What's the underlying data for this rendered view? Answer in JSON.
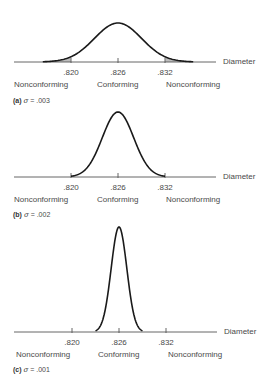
{
  "chart_data": [
    {
      "type": "line",
      "title": "(a) σ = .003",
      "panel": "a",
      "sigma": 0.003,
      "mean": 0.826,
      "xlabel": "Diameter",
      "ticks": [
        ".820",
        ".826",
        ".832"
      ],
      "tick_values": [
        0.82,
        0.826,
        0.832
      ],
      "regions": [
        "Nonconforming",
        "Conforming",
        "Nonconforming"
      ],
      "spec_limits": [
        0.82,
        0.832
      ],
      "shaded_tails": true,
      "grid": false
    },
    {
      "type": "line",
      "title": "(b) σ = .002",
      "panel": "b",
      "sigma": 0.002,
      "mean": 0.826,
      "xlabel": "Diameter",
      "ticks": [
        ".820",
        ".826",
        ".832"
      ],
      "tick_values": [
        0.82,
        0.826,
        0.832
      ],
      "regions": [
        "Nonconforming",
        "Conforming",
        "Nonconforming"
      ],
      "spec_limits": [
        0.82,
        0.832
      ],
      "shaded_tails": false,
      "grid": false
    },
    {
      "type": "line",
      "title": "(c) σ = .001",
      "panel": "c",
      "sigma": 0.001,
      "mean": 0.826,
      "xlabel": "Diameter",
      "ticks": [
        ".820",
        ".826",
        ".832"
      ],
      "tick_values": [
        0.82,
        0.826,
        0.832
      ],
      "regions": [
        "Nonconforming",
        "Conforming",
        "Nonconforming"
      ],
      "spec_limits": [
        0.82,
        0.832
      ],
      "shaded_tails": false,
      "grid": false
    }
  ],
  "panels": [
    {
      "letter": "(a)",
      "sigma_sym": "σ",
      "eq": " = ",
      "sigma_val": ".003",
      "axis_label": "Diameter",
      "ticks": [
        ".820",
        ".826",
        ".832"
      ],
      "regions": [
        "Nonconforming",
        "Conforming",
        "Nonconforming"
      ]
    },
    {
      "letter": "(b)",
      "sigma_sym": "σ",
      "eq": " = ",
      "sigma_val": ".002",
      "axis_label": "Diameter",
      "ticks": [
        ".820",
        ".826",
        ".832"
      ],
      "regions": [
        "Nonconforming",
        "Conforming",
        "Nonconforming"
      ]
    },
    {
      "letter": "(c)",
      "sigma_sym": "σ",
      "eq": " = ",
      "sigma_val": ".001",
      "axis_label": "Diameter",
      "ticks": [
        ".820",
        ".826",
        ".832"
      ],
      "regions": [
        "Nonconforming",
        "Conforming",
        "Nonconforming"
      ]
    }
  ],
  "colors": {
    "curve": "#1a1a1a",
    "axis": "#555555",
    "shade": "#bdbdbd",
    "text": "#4a4a4a"
  }
}
